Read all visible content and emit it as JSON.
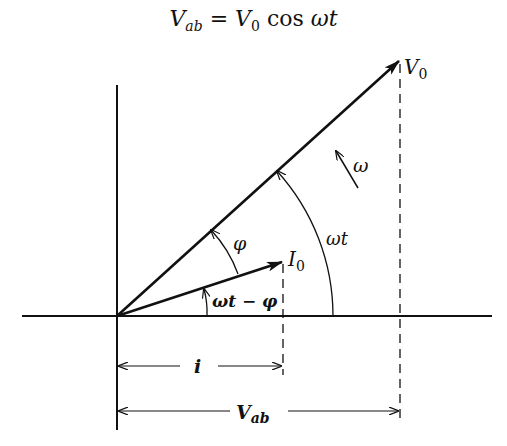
{
  "equation": {
    "lhs_symbol": "V",
    "lhs_sub": "ab",
    "equals": "=",
    "rhs_symbol": "V",
    "rhs_sub": "0",
    "rhs_func": "cos",
    "rhs_arg": "ωt"
  },
  "diagram": {
    "labels": {
      "v0_symbol": "V",
      "v0_sub": "0",
      "i0_symbol": "I",
      "i0_sub": "0",
      "omega": "ω",
      "omega_t": "ωt",
      "phi": "φ",
      "omega_t_minus_phi": "ωt − φ",
      "i_projection": "i",
      "vab_symbol": "V",
      "vab_sub": "ab"
    },
    "colors": {
      "ink": "#111111",
      "background": "#ffffff"
    }
  }
}
